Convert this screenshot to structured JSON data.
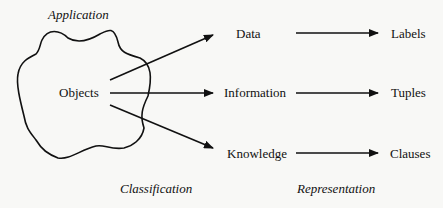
{
  "diagram": {
    "region_title": "Application",
    "source_node": "Objects",
    "classification_label": "Classification",
    "representation_label": "Representation",
    "categories": [
      {
        "name": "Data",
        "representation": "Labels"
      },
      {
        "name": "Information",
        "representation": "Tuples"
      },
      {
        "name": "Knowledge",
        "representation": "Clauses"
      }
    ],
    "colors": {
      "stroke": "#111111",
      "background": "#f8f8f6"
    }
  }
}
